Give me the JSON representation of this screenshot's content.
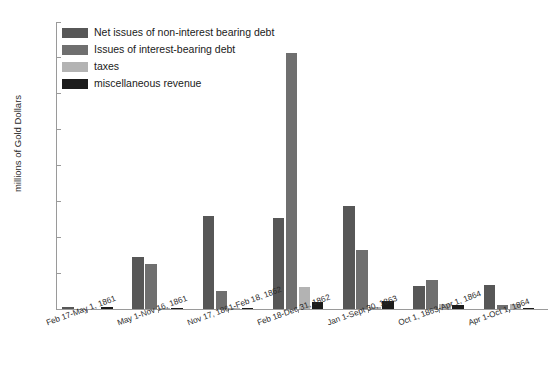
{
  "chart_data": {
    "type": "bar",
    "title": "",
    "xlabel": "",
    "ylabel": "millions of Gold Dollars",
    "ylim": [
      0,
      160
    ],
    "yticks": [
      0,
      20,
      40,
      60,
      80,
      100,
      120,
      140,
      160
    ],
    "grid": false,
    "legend_position": "upper-left inside",
    "categories": [
      "Feb 17-May 1, 1861",
      "May 1-Nov 16, 1861",
      "Nov 17, 1861-Feb 18, 1862",
      "Feb 18-Dec 31, 1862",
      "Jan 1-Sept 30, 1863",
      "Oct 1, 1863-Apr 1, 1864",
      "Apr 1-Oct 1, 1864"
    ],
    "series": [
      {
        "name": "Net issues of non-interest bearing debt",
        "color": "#575757",
        "values": [
          1.2,
          29.0,
          52.0,
          51.0,
          57.5,
          13.0,
          13.2
        ]
      },
      {
        "name": "Issues of interest-bearing debt",
        "color": "#6f6f6f",
        "values": [
          0.0,
          25.0,
          10.2,
          143.0,
          33.0,
          16.0,
          2.0
        ]
      },
      {
        "name": "taxes",
        "color": "#b3b3b3",
        "values": [
          0.0,
          0.4,
          0.5,
          12.2,
          1.0,
          3.0,
          2.6
        ]
      },
      {
        "name": "miscellaneous revenue",
        "color": "#1c1c1c",
        "values": [
          0.9,
          0.3,
          0.4,
          4.0,
          4.2,
          2.4,
          0.8
        ]
      }
    ]
  },
  "axis": {
    "tick_labels": [
      "0",
      "20",
      "40",
      "60",
      "80",
      "100",
      "120",
      "140",
      "160"
    ]
  }
}
